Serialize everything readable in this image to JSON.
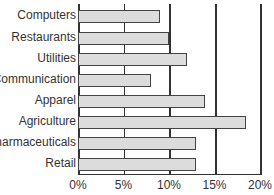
{
  "chart_data": {
    "type": "bar",
    "orientation": "horizontal",
    "title": "",
    "xlabel": "",
    "ylabel": "",
    "categories": [
      "Computers",
      "Restaurants",
      "Utilities",
      "Communication",
      "Apparel",
      "Agriculture",
      "Pharmaceuticals",
      "Retail"
    ],
    "values": [
      9,
      10,
      12,
      8,
      14,
      18.5,
      13,
      13
    ],
    "xlim": [
      0,
      20
    ],
    "x_ticks": [
      "0%",
      "5%",
      "10%",
      "15%",
      "20%"
    ],
    "grid": "vertical",
    "bar_color": "#dcdcdc",
    "bar_edge_color": "#444444"
  }
}
